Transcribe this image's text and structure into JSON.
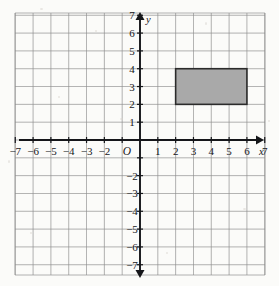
{
  "figure": {
    "background_color": "#fbfbf9"
  },
  "chart_data": {
    "type": "scatter",
    "title": "",
    "xlabel": "x",
    "ylabel": "y",
    "origin_label": "O",
    "grid": true,
    "xlim": [
      -7.6,
      7.6
    ],
    "ylim": [
      -7.6,
      7.6
    ],
    "xticks": [
      -7,
      -6,
      -5,
      -4,
      -3,
      -2,
      1,
      2,
      3,
      4,
      5,
      6,
      7
    ],
    "yticks": [
      7,
      6,
      5,
      4,
      3,
      2,
      1,
      -2,
      -3,
      -4,
      -5,
      -6,
      -7
    ],
    "xtick_labels": [
      "-7",
      "-6",
      "-5",
      "-4",
      "-3",
      "-2",
      "1",
      "2",
      "3",
      "4",
      "5",
      "6",
      "7"
    ],
    "ytick_labels": [
      "7",
      "6",
      "5",
      "4",
      "3",
      "2",
      "1",
      "-2",
      "-3",
      "-4",
      "-5",
      "-6",
      "-7"
    ],
    "tick_step": 1,
    "grid_color": "#8d8d8d",
    "axis_color": "#15161a",
    "shapes": [
      {
        "name": "rectangle",
        "type": "rectangle",
        "vertices": [
          [
            2,
            2
          ],
          [
            6,
            2
          ],
          [
            6,
            4
          ],
          [
            2,
            4
          ]
        ],
        "x_min": 2,
        "x_max": 6,
        "y_min": 2,
        "y_max": 4,
        "width": 4,
        "height": 2,
        "fill": "#a9a9a9",
        "stroke": "#2b2b2b"
      }
    ]
  },
  "labels": {
    "x_axis": "x",
    "y_axis": "y",
    "origin": "O"
  }
}
